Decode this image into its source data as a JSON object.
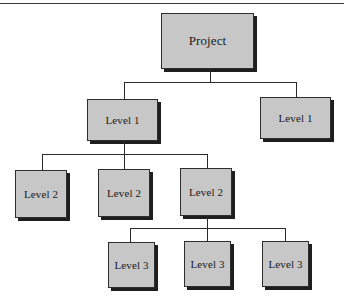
{
  "diagram": {
    "type": "hierarchy",
    "root": {
      "label": "Project"
    },
    "level1": [
      {
        "label": "Level 1"
      },
      {
        "label": "Level 1"
      }
    ],
    "level2": [
      {
        "label": "Level 2"
      },
      {
        "label": "Level 2"
      },
      {
        "label": "Level 2"
      }
    ],
    "level3": [
      {
        "label": "Level 3"
      },
      {
        "label": "Level 3"
      },
      {
        "label": "Level 3"
      }
    ],
    "colors": {
      "box_fill": "#c7c7c7",
      "box_border": "#2e2e2e",
      "shadow": "#1e1e1e",
      "connector": "#2a2a2a"
    }
  }
}
